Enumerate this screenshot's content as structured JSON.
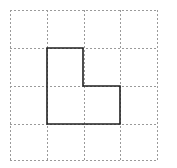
{
  "diagram": {
    "type": "grid-shape",
    "grid": {
      "rows": 4,
      "cols": 4,
      "origin_x": 10,
      "origin_y": 10,
      "x_lines": [
        10,
        47,
        84,
        120,
        157
      ],
      "y_lines": [
        10,
        48,
        86,
        124,
        160
      ],
      "line_color": "#9a9a9a",
      "dash": "2,2"
    },
    "shape": {
      "name": "L-shape",
      "cells": [
        [
          1,
          1
        ],
        [
          2,
          1
        ],
        [
          2,
          2
        ]
      ],
      "points": [
        [
          47,
          48
        ],
        [
          83,
          48
        ],
        [
          83,
          86
        ],
        [
          120,
          86
        ],
        [
          120,
          124
        ],
        [
          47,
          124
        ]
      ],
      "stroke_color": "#222222",
      "stroke_width": 1.6
    }
  }
}
